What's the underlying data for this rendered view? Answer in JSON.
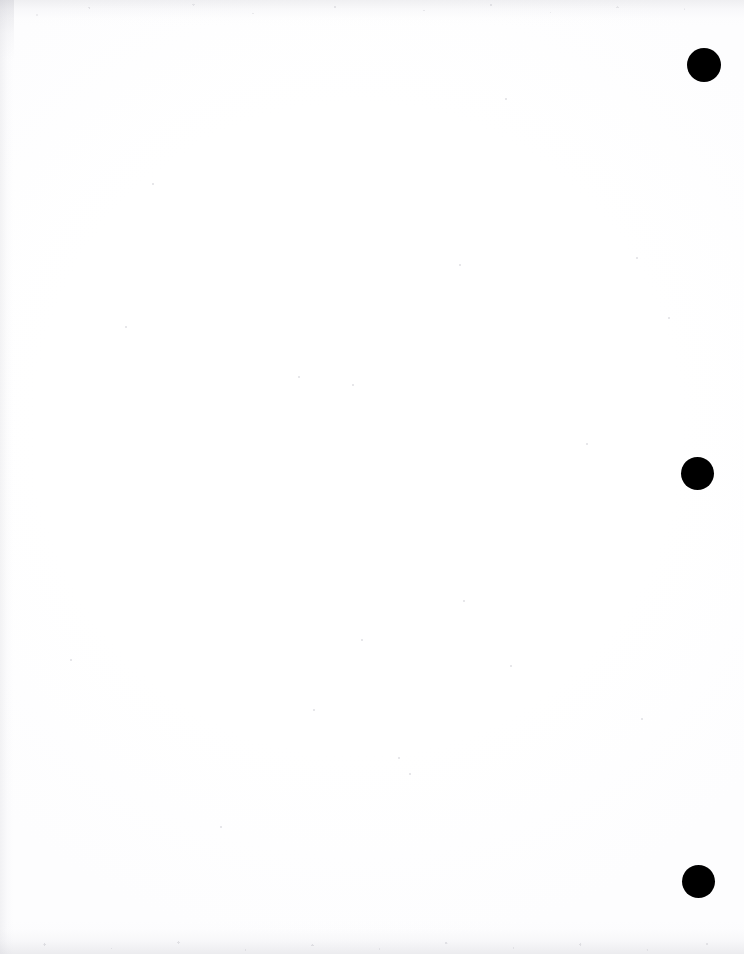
{
  "document": {
    "kind": "scanned-page",
    "page_content": "",
    "body_text": "",
    "page_width": 744,
    "page_height": 954,
    "background_color": "#ffffff",
    "mark_color": "#000000",
    "scan_artifact_color": "#cccdd2"
  },
  "marks": {
    "label": "binding-hole-marks",
    "count": 3,
    "shape": "filled-circle",
    "color": "#000000",
    "items": [
      {
        "name": "mark-1",
        "center_x": 704,
        "center_y": 65,
        "diameter": 34
      },
      {
        "name": "mark-2",
        "center_x": 697,
        "center_y": 473,
        "diameter": 33
      },
      {
        "name": "mark-3",
        "center_x": 698,
        "center_y": 881,
        "diameter": 33
      }
    ]
  },
  "artifacts": {
    "top_band": {
      "height": 26,
      "color": "#cecdd4"
    },
    "bottom_band": {
      "height": 34,
      "color": "#cacad1"
    },
    "left_edge": {
      "width": 16,
      "color": "#d0d0d6"
    },
    "specks": [
      {
        "x": 152,
        "y": 183,
        "size": 2
      },
      {
        "x": 298,
        "y": 376,
        "size": 2
      },
      {
        "x": 352,
        "y": 384,
        "size": 2
      },
      {
        "x": 361,
        "y": 639,
        "size": 2
      },
      {
        "x": 459,
        "y": 264,
        "size": 2
      },
      {
        "x": 463,
        "y": 600,
        "size": 2
      },
      {
        "x": 505,
        "y": 98,
        "size": 2
      },
      {
        "x": 510,
        "y": 665,
        "size": 2
      },
      {
        "x": 636,
        "y": 257,
        "size": 2
      },
      {
        "x": 641,
        "y": 718,
        "size": 2
      },
      {
        "x": 125,
        "y": 326,
        "size": 2
      },
      {
        "x": 70,
        "y": 659,
        "size": 2
      },
      {
        "x": 220,
        "y": 826,
        "size": 2
      },
      {
        "x": 409,
        "y": 773,
        "size": 2
      },
      {
        "x": 586,
        "y": 443,
        "size": 2
      },
      {
        "x": 668,
        "y": 317,
        "size": 2
      },
      {
        "x": 313,
        "y": 709,
        "size": 2
      },
      {
        "x": 398,
        "y": 757,
        "size": 2
      }
    ]
  }
}
